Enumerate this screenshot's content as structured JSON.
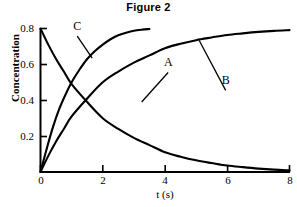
{
  "chart_data": {
    "type": "line",
    "title": "Figure 2",
    "xlabel": "t (s)",
    "ylabel": "Concentration",
    "xlim": [
      0,
      8
    ],
    "ylim": [
      0,
      0.8
    ],
    "xticks": [
      "0",
      "2",
      "4",
      "6",
      "8"
    ],
    "xtick_values": [
      0,
      2,
      4,
      6,
      8
    ],
    "yticks": [
      "0.2",
      "0.4",
      "0.6",
      "0.8"
    ],
    "ytick_values": [
      0.2,
      0.4,
      0.6,
      0.8
    ],
    "grid": false,
    "legend": "inline-curve-labels",
    "line_color": "#000000",
    "series": [
      {
        "name": "A",
        "label": "A",
        "description": "exponential decay from 0.8 to 0",
        "x": [
          0,
          0.25,
          0.5,
          0.75,
          1,
          1.5,
          2,
          2.5,
          3,
          3.5,
          4,
          4.5,
          5,
          5.5,
          6,
          6.5,
          7,
          7.5,
          8
        ],
        "y": [
          0.8,
          0.71,
          0.63,
          0.56,
          0.49,
          0.39,
          0.3,
          0.24,
          0.19,
          0.15,
          0.11,
          0.085,
          0.065,
          0.05,
          0.036,
          0.027,
          0.019,
          0.013,
          0.009
        ]
      },
      {
        "name": "B",
        "label": "B",
        "description": "slow exponential rise from 0 to 0.8",
        "x": [
          0,
          0.25,
          0.5,
          0.75,
          1,
          1.5,
          2,
          2.5,
          3,
          3.5,
          4,
          4.5,
          5,
          5.5,
          6,
          6.5,
          7,
          7.5,
          8
        ],
        "y": [
          0,
          0.09,
          0.17,
          0.24,
          0.31,
          0.41,
          0.5,
          0.56,
          0.61,
          0.65,
          0.69,
          0.715,
          0.735,
          0.75,
          0.764,
          0.773,
          0.781,
          0.787,
          0.791
        ]
      },
      {
        "name": "C",
        "label": "C",
        "description": "fast exponential rise from 0 to 0.8, plateau reached near t = 3.5",
        "x": [
          0,
          0.2,
          0.4,
          0.6,
          0.8,
          1,
          1.25,
          1.5,
          1.75,
          2,
          2.25,
          2.5,
          2.75,
          3,
          3.25,
          3.5
        ],
        "y": [
          0,
          0.13,
          0.25,
          0.35,
          0.43,
          0.5,
          0.57,
          0.63,
          0.675,
          0.71,
          0.74,
          0.762,
          0.776,
          0.787,
          0.793,
          0.797
        ]
      }
    ],
    "annotations": [
      {
        "name": "A",
        "text": "A",
        "x": 4.1,
        "y": 0.555,
        "leader_to_x": 3.25,
        "leader_to_y": 0.39
      },
      {
        "name": "B",
        "text": "B",
        "x": 5.95,
        "y": 0.455,
        "leader_to_x": 5.1,
        "leader_to_y": 0.733
      },
      {
        "name": "C",
        "text": "C",
        "x": 1.18,
        "y": 0.758,
        "leader_to_x": 1.66,
        "leader_to_y": 0.635
      }
    ]
  },
  "chart": {
    "title": "Figure 2",
    "axis": {
      "y_label": "Concentration",
      "x_label": "t (s)",
      "y_tick_0": "0.8",
      "y_tick_1": "0.6",
      "y_tick_2": "0.4",
      "y_tick_3": "0.2",
      "x_tick_0": "0",
      "x_tick_1": "2",
      "x_tick_2": "4",
      "x_tick_3": "6",
      "x_tick_4": "8"
    },
    "curve_labels": {
      "a": "A",
      "b": "B",
      "c": "C"
    }
  }
}
